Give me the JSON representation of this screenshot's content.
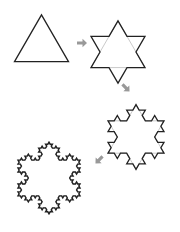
{
  "diagram": {
    "title": "Koch snowflake construction",
    "stages": [
      {
        "name": "iteration-0",
        "label": "Triangle",
        "iterations": 0
      },
      {
        "name": "iteration-1",
        "label": "Star",
        "iterations": 1
      },
      {
        "name": "iteration-2",
        "label": "Snowflake iteration 2",
        "iterations": 2
      },
      {
        "name": "iteration-3",
        "label": "Snowflake iteration 3",
        "iterations": 3
      }
    ],
    "arrows": [
      {
        "name": "arrow-right",
        "direction": "right"
      },
      {
        "name": "arrow-down-right",
        "direction": "down-right"
      },
      {
        "name": "arrow-down-left",
        "direction": "down-left"
      }
    ],
    "colors": {
      "outline": "#222222",
      "previous_edge": "#bbbbbb",
      "arrow": "#999999",
      "background": "#ffffff"
    }
  }
}
